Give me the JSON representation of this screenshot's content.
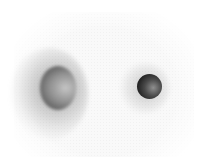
{
  "image": {
    "description": "Grayscale image of two shaded spheres on a white speckled background",
    "background_color": "#ffffff",
    "objects": [
      {
        "name": "large-sphere",
        "position": "left",
        "center": [
          58,
          88
        ],
        "tone": "mid-gray, blurred, dark left rim",
        "color": "#6a6a6a"
      },
      {
        "name": "small-sphere",
        "position": "right",
        "center": [
          149,
          86
        ],
        "tone": "dark gray, sharp",
        "color": "#2a2a2a"
      }
    ]
  }
}
